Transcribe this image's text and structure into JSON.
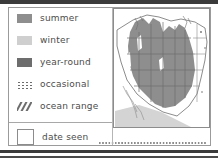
{
  "figure": {
    "kind": "field-guide-range-map-legend",
    "title_visible": false
  },
  "legend": {
    "items": [
      {
        "label": "summer",
        "swatch": "solid-medium-gray",
        "color": "#8e8e8e"
      },
      {
        "label": "winter",
        "swatch": "solid-light-gray",
        "color": "#cfcfcf"
      },
      {
        "label": "year-round",
        "swatch": "solid-dark-gray",
        "color": "#6d6d6d"
      },
      {
        "label": "occasional",
        "swatch": "dotted-grid",
        "color": "#6d6d6d"
      },
      {
        "label": "ocean range",
        "swatch": "diagonal-hatch",
        "color": "#6d6d6d"
      }
    ],
    "footer": {
      "label": "date seen",
      "swatch": "empty-check-box",
      "has_write_in_line": true
    }
  },
  "map": {
    "region": "western United States",
    "range_fill_color": "#8e8e8e",
    "ocean_fill_color": "#d4d4d4",
    "outline_color": "#6f6f6f",
    "border_color": "#8c8c8c"
  },
  "colors": {
    "page_background": "#ffffff",
    "frame_border": "#9b9b9b",
    "text": "#4c4c4c",
    "scan_rule": "#3b3b3b"
  }
}
